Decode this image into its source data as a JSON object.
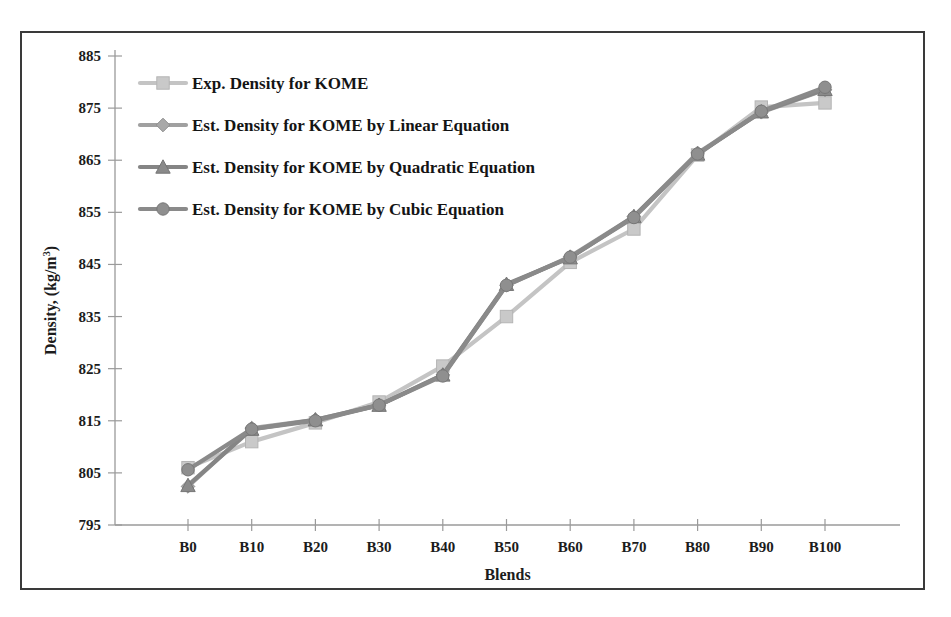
{
  "chart_data": {
    "type": "line",
    "title": "",
    "xlabel": "Blends",
    "ylabel": "Density, (kg/m",
    "ylabel_superscript": "3",
    "ylabel_suffix": ")",
    "categories": [
      "B0",
      "B10",
      "B20",
      "B30",
      "B40",
      "B50",
      "B60",
      "B70",
      "B80",
      "B90",
      "B100"
    ],
    "ylim": [
      795,
      885
    ],
    "yticks": [
      795,
      805,
      815,
      825,
      835,
      845,
      855,
      865,
      875,
      885
    ],
    "grid": false,
    "legend_position": "upper-left-inside",
    "series": [
      {
        "name": "Exp. Density for KOME",
        "marker": "square",
        "color": "#c9c9c9",
        "line_color": "#c4c4c4",
        "values": [
          806.0,
          811.0,
          814.6,
          818.6,
          825.5,
          835.0,
          845.4,
          851.8,
          866.0,
          875.2,
          876.0
        ]
      },
      {
        "name": "Est. Density for KOME by Linear Equation",
        "marker": "diamond",
        "color": "#a8a8a8",
        "line_color": "#a0a0a0",
        "values": [
          802.4,
          813.6,
          815.2,
          818.0,
          823.8,
          841.0,
          846.5,
          854.2,
          866.4,
          874.2,
          878.5
        ]
      },
      {
        "name": "Est. Density for KOME by Quadratic Equation",
        "marker": "triangle",
        "color": "#8a8a8a",
        "line_color": "#858585",
        "values": [
          802.6,
          813.4,
          815.2,
          818.0,
          823.8,
          841.2,
          846.3,
          854.2,
          866.2,
          874.3,
          878.6
        ]
      },
      {
        "name": "Est. Density for KOME by Cubic Equation",
        "marker": "circle",
        "color": "#8f8f8f",
        "line_color": "#8a8a8a",
        "values": [
          805.6,
          813.4,
          815.0,
          818.0,
          823.6,
          841.0,
          846.4,
          854.0,
          866.2,
          874.4,
          879.0
        ]
      }
    ]
  }
}
